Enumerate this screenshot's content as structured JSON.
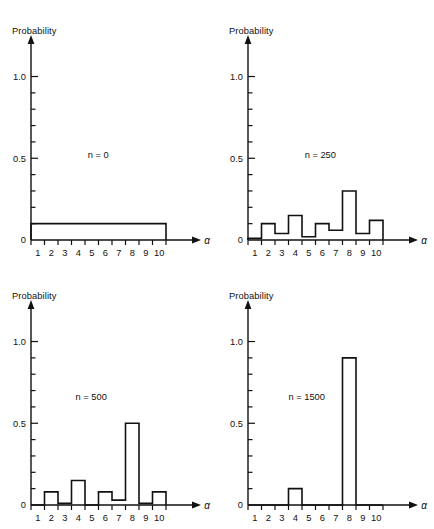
{
  "figure": {
    "background": "#ffffff",
    "ink": "#111111",
    "panel_count": 4
  },
  "axes": {
    "ylabel": "Probability",
    "xlabel": "α",
    "y_major_ticks": [
      0,
      0.5,
      1.0
    ],
    "y_major_tick_labels": [
      "0",
      "0.5",
      "1.0"
    ],
    "y_minor_tick_step": 0.1,
    "ylim": [
      0,
      1.15
    ],
    "x_tick_labels": [
      "1",
      "2",
      "3",
      "4",
      "5",
      "6",
      "7",
      "8",
      "9",
      "10"
    ],
    "xlim": [
      0.5,
      10.5
    ],
    "grid": false,
    "legend": "none"
  },
  "chart_data": [
    {
      "type": "bar",
      "title": "n = 0",
      "annotation": "n = 0",
      "xlabel": "α",
      "ylabel": "Probability",
      "categories": [
        "1",
        "2",
        "3",
        "4",
        "5",
        "6",
        "7",
        "8",
        "9",
        "10"
      ],
      "values": [
        0.1,
        0.1,
        0.1,
        0.1,
        0.1,
        0.1,
        0.1,
        0.1,
        0.1,
        0.1
      ],
      "ylim": [
        0,
        1.15
      ],
      "yticks": [
        0,
        0.5,
        1.0
      ]
    },
    {
      "type": "bar",
      "title": "n = 250",
      "annotation": "n = 250",
      "xlabel": "α",
      "ylabel": "Probability",
      "categories": [
        "1",
        "2",
        "3",
        "4",
        "5",
        "6",
        "7",
        "8",
        "9",
        "10"
      ],
      "values": [
        0.01,
        0.1,
        0.04,
        0.15,
        0.02,
        0.1,
        0.06,
        0.3,
        0.04,
        0.12
      ],
      "ylim": [
        0,
        1.15
      ],
      "yticks": [
        0,
        0.5,
        1.0
      ]
    },
    {
      "type": "bar",
      "title": "n = 500",
      "annotation": "n = 500",
      "xlabel": "α",
      "ylabel": "Probability",
      "categories": [
        "1",
        "2",
        "3",
        "4",
        "5",
        "6",
        "7",
        "8",
        "9",
        "10"
      ],
      "values": [
        0.0,
        0.08,
        0.01,
        0.15,
        0.0,
        0.08,
        0.03,
        0.5,
        0.01,
        0.08
      ],
      "ylim": [
        0,
        1.15
      ],
      "yticks": [
        0,
        0.5,
        1.0
      ]
    },
    {
      "type": "bar",
      "title": "n = 1500",
      "annotation": "n = 1500",
      "xlabel": "α",
      "ylabel": "Probability",
      "categories": [
        "1",
        "2",
        "3",
        "4",
        "5",
        "6",
        "7",
        "8",
        "9",
        "10"
      ],
      "values": [
        0.0,
        0.0,
        0.0,
        0.1,
        0.0,
        0.0,
        0.0,
        0.9,
        0.0,
        0.0
      ],
      "ylim": [
        0,
        1.15
      ],
      "yticks": [
        0,
        0.5,
        1.0
      ]
    }
  ],
  "annotation_positions": [
    {
      "x": 0.42,
      "y": 0.5
    },
    {
      "x": 0.42,
      "y": 0.5
    },
    {
      "x": 0.33,
      "y": 0.64
    },
    {
      "x": 0.3,
      "y": 0.64
    }
  ]
}
